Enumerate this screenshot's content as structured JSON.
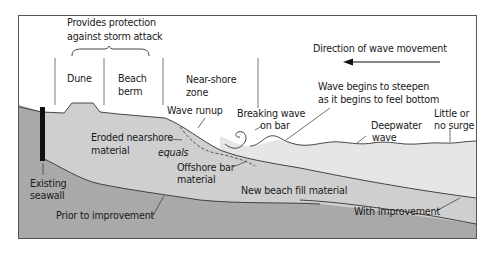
{
  "diagram": {
    "title_bracket": {
      "line1": "Provides protection",
      "line2": "against storm attack"
    },
    "zones": [
      {
        "line1": "Dune",
        "line2": ""
      },
      {
        "line1": "Beach",
        "line2": "berm"
      },
      {
        "line1": "Near-shore",
        "line2": "zone"
      }
    ],
    "direction": {
      "label": "Direction of wave movement",
      "arrow": "arrow-left-icon"
    },
    "annotations": {
      "wave_runup": "Wave runup",
      "breaking_wave_1": "Breaking wave",
      "breaking_wave_2": "on bar",
      "steepen_1": "Wave begins to steepen",
      "steepen_2": "as it begins to feel bottom",
      "deepwater_1": "Deepwater",
      "deepwater_2": "wave",
      "little_surge_1": "Little or",
      "little_surge_2": "no surge",
      "eroded_1": "Eroded nearshore",
      "eroded_2": "material",
      "equals": "equals",
      "offshore_1": "Offshore bar",
      "offshore_2": "material",
      "seawall_1": "Existing",
      "seawall_2": "seawall",
      "new_fill": "New beach fill material",
      "prior": "Prior to improvement",
      "with": "With improvement"
    },
    "colors": {
      "frame": "#555555",
      "sky": "#ffffff",
      "water": "#e6e6e6",
      "fill": "#cfcfcf",
      "base": "#a9a9a9",
      "seawall": "#111111",
      "line": "#333333"
    }
  }
}
